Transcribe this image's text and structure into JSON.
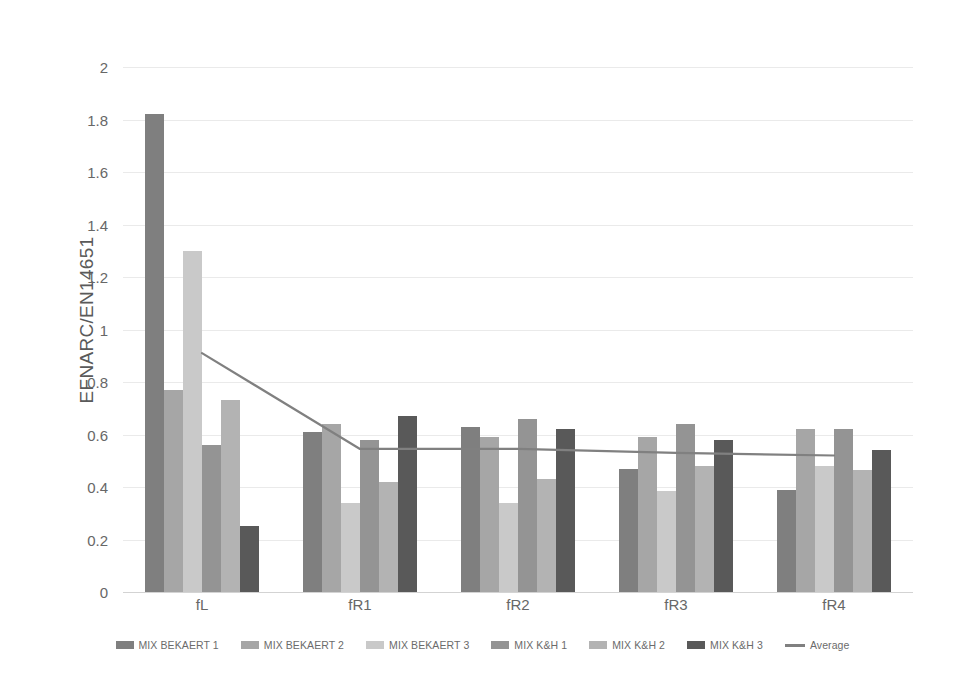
{
  "chart_data": {
    "type": "bar",
    "title": "",
    "subtitle": "",
    "xlabel": "",
    "ylabel": "EFNARC/EN14651",
    "categories": [
      "fL",
      "fR1",
      "fR2",
      "fR3",
      "fR4"
    ],
    "ylim": [
      0,
      2
    ],
    "ytick_labels": [
      "0",
      "0.2",
      "0.4",
      "0.6",
      "0.8",
      "1",
      "1.2",
      "1.4",
      "1.6",
      "1.8",
      "2"
    ],
    "ytick_values": [
      0,
      0.2,
      0.4,
      0.6,
      0.8,
      1,
      1.2,
      1.4,
      1.6,
      1.8,
      2
    ],
    "grid": true,
    "legend_position": "bottom",
    "series": [
      {
        "name": "MIX BEKAERT 1",
        "color": "#7f7f7f",
        "type": "bar",
        "values": [
          1.82,
          0.61,
          0.63,
          0.47,
          0.39
        ]
      },
      {
        "name": "MIX BEKAERT 2",
        "color": "#a6a6a6",
        "type": "bar",
        "values": [
          0.77,
          0.64,
          0.59,
          0.59,
          0.62
        ]
      },
      {
        "name": "MIX BEKAERT 3",
        "color": "#c9c9c9",
        "type": "bar",
        "values": [
          1.3,
          0.34,
          0.34,
          0.385,
          0.48
        ]
      },
      {
        "name": "MIX K&H 1",
        "color": "#949494",
        "type": "bar",
        "values": [
          0.56,
          0.58,
          0.66,
          0.64,
          0.62
        ]
      },
      {
        "name": "MIX K&H 2",
        "color": "#b3b3b3",
        "type": "bar",
        "values": [
          0.73,
          0.42,
          0.43,
          0.48,
          0.465
        ]
      },
      {
        "name": "MIX K&H 3",
        "color": "#595959",
        "type": "bar",
        "values": [
          0.25,
          0.67,
          0.62,
          0.58,
          0.54
        ]
      },
      {
        "name": "Average",
        "color": "#808080",
        "type": "line",
        "values": [
          0.91,
          0.545,
          0.545,
          0.53,
          0.52
        ]
      }
    ]
  },
  "legend": {
    "items": [
      {
        "label": "MIX BEKAERT 1",
        "swatch": "bar"
      },
      {
        "label": "MIX BEKAERT 2",
        "swatch": "bar"
      },
      {
        "label": "MIX BEKAERT 3",
        "swatch": "bar"
      },
      {
        "label": "MIX K&H 1",
        "swatch": "bar"
      },
      {
        "label": "MIX K&H 2",
        "swatch": "bar"
      },
      {
        "label": "MIX K&H 3",
        "swatch": "bar"
      },
      {
        "label": "Average",
        "swatch": "line"
      }
    ]
  }
}
